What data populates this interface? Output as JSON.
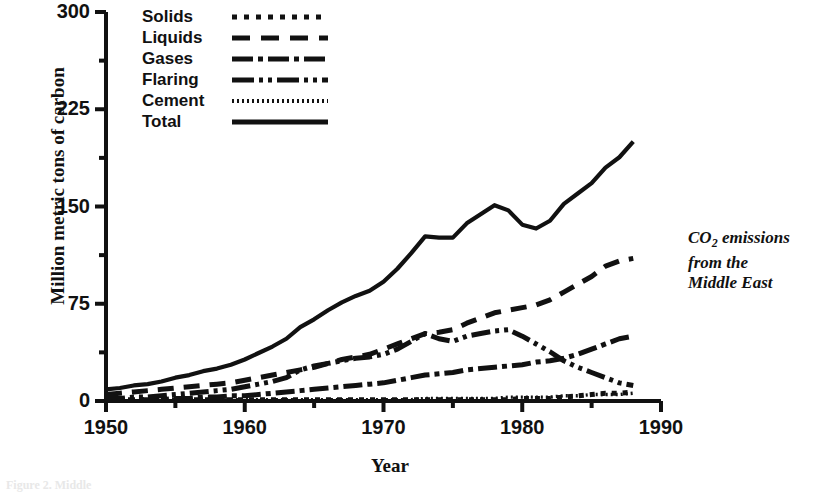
{
  "chart_data": {
    "type": "line",
    "title": "",
    "annotation": "CO2 emissions from the Middle East",
    "annotation_lines": [
      "CO2 emissions",
      "from the",
      "Middle East"
    ],
    "xlabel": "Year",
    "ylabel": "Million metric tons of carbon",
    "xlim": [
      1950,
      1990
    ],
    "ylim": [
      0,
      300
    ],
    "xticks": [
      1950,
      1960,
      1970,
      1980,
      1990
    ],
    "xtick_labels": [
      "1950",
      "1960",
      "1970",
      "1980",
      "1990"
    ],
    "x_minor_ticks": [
      1955,
      1965,
      1975,
      1985
    ],
    "yticks": [
      0,
      75,
      150,
      225,
      300
    ],
    "ytick_labels": [
      "0",
      "75",
      "150",
      "225",
      "300"
    ],
    "y_minor_ticks": [
      37.5,
      112.5,
      187.5,
      262.5
    ],
    "grid": false,
    "legend_position": "top-left-inside",
    "x": [
      1950,
      1951,
      1952,
      1953,
      1954,
      1955,
      1956,
      1957,
      1958,
      1959,
      1960,
      1961,
      1962,
      1963,
      1964,
      1965,
      1966,
      1967,
      1968,
      1969,
      1970,
      1971,
      1972,
      1973,
      1974,
      1975,
      1976,
      1977,
      1978,
      1979,
      1980,
      1981,
      1982,
      1983,
      1984,
      1985,
      1986,
      1987,
      1988
    ],
    "series": [
      {
        "name": "Solids",
        "dash": "dotted-square",
        "values": [
          1,
          1,
          1,
          1,
          1,
          1,
          1,
          1,
          1,
          1,
          1,
          1,
          1,
          1,
          1,
          1,
          1,
          1,
          1,
          1,
          1,
          1,
          1,
          1,
          1,
          1,
          1,
          1,
          1,
          1,
          2,
          2,
          2,
          3,
          4,
          5,
          6,
          6,
          7
        ]
      },
      {
        "name": "Liquids",
        "dash": "dashed",
        "values": [
          5,
          6,
          7,
          8,
          9,
          10,
          11,
          12,
          13,
          14,
          16,
          18,
          20,
          22,
          24,
          26,
          29,
          32,
          34,
          36,
          40,
          44,
          48,
          52,
          53,
          55,
          60,
          64,
          68,
          70,
          72,
          74,
          78,
          84,
          90,
          96,
          104,
          108,
          110
        ]
      },
      {
        "name": "Gases",
        "dash": "dash-dot",
        "values": [
          1,
          1,
          1,
          1,
          1,
          2,
          2,
          3,
          3,
          4,
          4,
          5,
          6,
          7,
          8,
          9,
          10,
          11,
          12,
          13,
          14,
          16,
          18,
          20,
          21,
          22,
          24,
          25,
          26,
          27,
          28,
          30,
          31,
          33,
          36,
          40,
          44,
          48,
          50
        ]
      },
      {
        "name": "Flaring",
        "dash": "dash-dot-dot",
        "values": [
          2,
          2,
          3,
          3,
          4,
          5,
          6,
          7,
          8,
          9,
          11,
          13,
          15,
          18,
          24,
          27,
          29,
          31,
          33,
          34,
          36,
          40,
          46,
          52,
          48,
          46,
          50,
          52,
          54,
          55,
          50,
          44,
          38,
          31,
          26,
          22,
          18,
          14,
          12
        ]
      },
      {
        "name": "Cement",
        "dash": "fine-dotted",
        "values": [
          0,
          0,
          0,
          0,
          0,
          0,
          0,
          0,
          0,
          1,
          1,
          1,
          1,
          1,
          1,
          1,
          1,
          1,
          1,
          1,
          1,
          1,
          1,
          2,
          2,
          2,
          2,
          2,
          2,
          3,
          3,
          3,
          3,
          4,
          4,
          5,
          5,
          5,
          6
        ]
      },
      {
        "name": "Total",
        "dash": "solid",
        "values": [
          9,
          10,
          12,
          13,
          15,
          18,
          20,
          23,
          25,
          28,
          32,
          37,
          42,
          48,
          57,
          63,
          70,
          76,
          81,
          85,
          92,
          102,
          114,
          127,
          126,
          126,
          137,
          144,
          151,
          147,
          136,
          133,
          139,
          152,
          160,
          168,
          180,
          188,
          200
        ]
      }
    ]
  },
  "legend": {
    "items": [
      {
        "label": "Solids"
      },
      {
        "label": "Liquids"
      },
      {
        "label": "Gases"
      },
      {
        "label": "Flaring"
      },
      {
        "label": "Cement"
      },
      {
        "label": "Total"
      }
    ]
  },
  "caption": {
    "text": "Figure 2.  Middle"
  }
}
